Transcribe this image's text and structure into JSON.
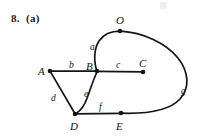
{
  "figure": {
    "problem_label": "8.  (a)",
    "type": "graph-diagram",
    "vertices": [
      {
        "id": "O",
        "label": "O",
        "x": 120,
        "y": 31,
        "label_x": 116,
        "label_y": 24
      },
      {
        "id": "A",
        "label": "A",
        "x": 50,
        "y": 71,
        "label_x": 38,
        "label_y": 72
      },
      {
        "id": "B",
        "label": "B",
        "x": 97,
        "y": 71,
        "label_x": 86,
        "label_y": 67
      },
      {
        "id": "C",
        "label": "C",
        "x": 143,
        "y": 72,
        "label_x": 139,
        "label_y": 66
      },
      {
        "id": "D",
        "label": "D",
        "x": 75,
        "y": 114,
        "label_x": 71,
        "label_y": 128
      },
      {
        "id": "E",
        "label": "E",
        "x": 121,
        "y": 113,
        "label_x": 117,
        "label_y": 128
      }
    ],
    "edges": [
      {
        "id": "a",
        "label": "a",
        "from": "B",
        "to": "O",
        "shape": "curve",
        "label_x": 92,
        "label_y": 48
      },
      {
        "id": "b",
        "label": "b",
        "from": "A",
        "to": "B",
        "shape": "line",
        "label_x": 70,
        "label_y": 67
      },
      {
        "id": "c",
        "label": "c",
        "from": "B",
        "to": "C",
        "shape": "line",
        "label_x": 117,
        "label_y": 67
      },
      {
        "id": "d",
        "label": "d",
        "from": "A",
        "to": "D",
        "shape": "line",
        "label_x": 53,
        "label_y": 99
      },
      {
        "id": "e",
        "label": "e",
        "from": "B",
        "to": "D",
        "shape": "curve",
        "label_x": 86,
        "label_y": 95
      },
      {
        "id": "f",
        "label": "f",
        "from": "D",
        "to": "E",
        "shape": "line",
        "label_x": 101,
        "label_y": 108
      },
      {
        "id": "g",
        "label": "g",
        "from": "O",
        "to": "E",
        "shape": "curve",
        "label_x": 183,
        "label_y": 92
      }
    ],
    "colors": {
      "stroke": "#141414",
      "background": "#ffffff"
    }
  }
}
